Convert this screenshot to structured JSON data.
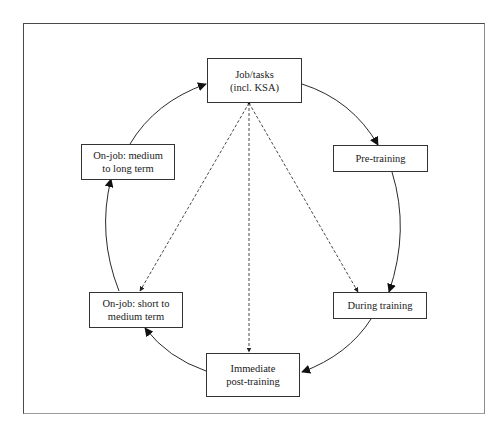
{
  "diagram": {
    "type": "cycle",
    "nodes": [
      {
        "id": "job",
        "label": "Job/tasks\n(incl. KSA)"
      },
      {
        "id": "pre",
        "label": "Pre-training"
      },
      {
        "id": "during",
        "label": "During training"
      },
      {
        "id": "post",
        "label": "Immediate\npost-training"
      },
      {
        "id": "short",
        "label": "On-job: short to\nmedium term"
      },
      {
        "id": "medium",
        "label": "On-job: medium\nto long term"
      }
    ],
    "cycle_edges": [
      {
        "from": "job",
        "to": "pre",
        "style": "solid"
      },
      {
        "from": "pre",
        "to": "during",
        "style": "solid"
      },
      {
        "from": "during",
        "to": "post",
        "style": "solid"
      },
      {
        "from": "post",
        "to": "short",
        "style": "solid"
      },
      {
        "from": "short",
        "to": "medium",
        "style": "solid"
      },
      {
        "from": "medium",
        "to": "job",
        "style": "solid"
      }
    ],
    "dashed_edges": [
      {
        "from": "job",
        "to": "during",
        "style": "dashed"
      },
      {
        "from": "job",
        "to": "post",
        "style": "dashed"
      },
      {
        "from": "job",
        "to": "short",
        "style": "dashed"
      }
    ],
    "colors": {
      "line": "#2a2a2a",
      "border": "#333333",
      "background": "#ffffff"
    }
  }
}
